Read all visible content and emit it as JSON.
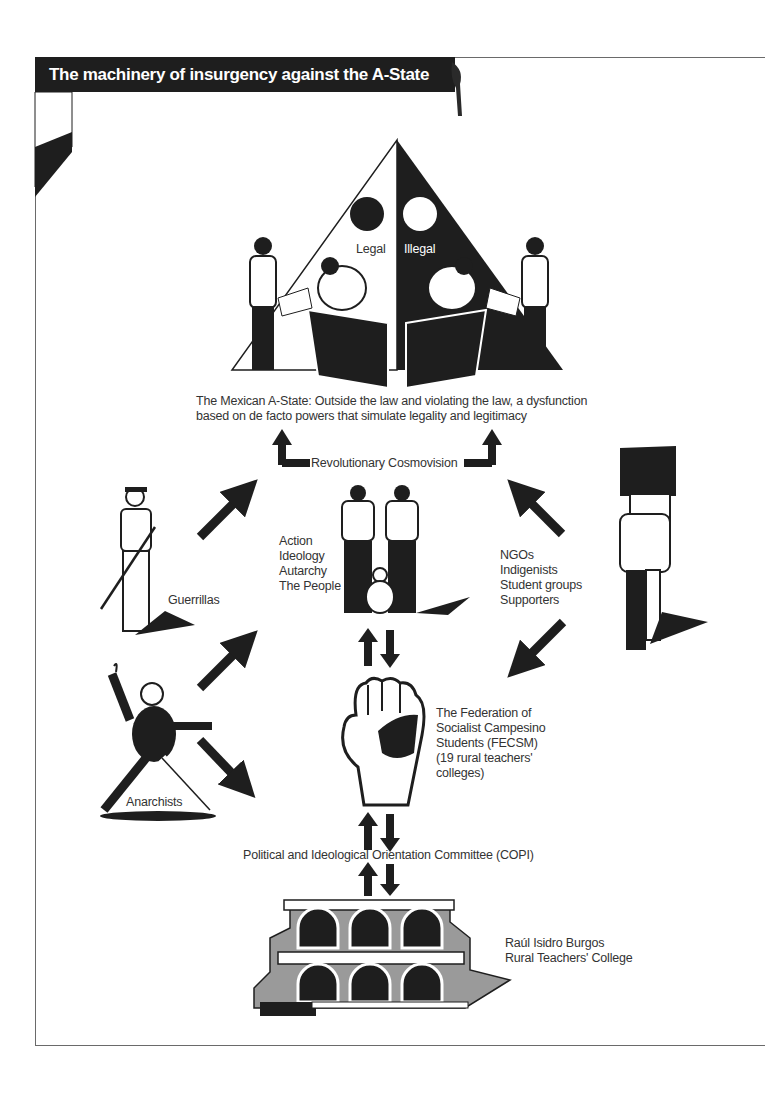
{
  "title": "The machinery of insurgency against the A-State",
  "pyramid": {
    "left_label": "Legal",
    "right_label": "Illegal"
  },
  "a_state_caption": [
    "The Mexican A-State: Outside the law and violating the law, a dysfunction",
    "based on de facto powers that simulate legality and legitimacy"
  ],
  "revolutionary_label": "Revolutionary Cosmovision",
  "center_group": {
    "lines": [
      "Action",
      "Ideology",
      "Autarchy",
      "The People"
    ]
  },
  "right_group": {
    "lines": [
      "NGOs",
      "Indigenists",
      "Student groups",
      "Supporters"
    ]
  },
  "guerrillas_label": "Guerrillas",
  "anarchists_label": "Anarchists",
  "fecsm": {
    "lines": [
      "The Federation of",
      "Socialist Campesino",
      "Students (FECSM)",
      "(19 rural teachers'",
      "colleges)"
    ]
  },
  "copi_label": "Political and Ideological Orientation Committee (COPI)",
  "college": {
    "lines": [
      "Raúl Isidro Burgos",
      "Rural Teachers' College"
    ]
  },
  "colors": {
    "ink": "#1e1e1e",
    "text": "#333333",
    "frame": "#6a6a6a",
    "building_gray": "#9a9a9a"
  }
}
